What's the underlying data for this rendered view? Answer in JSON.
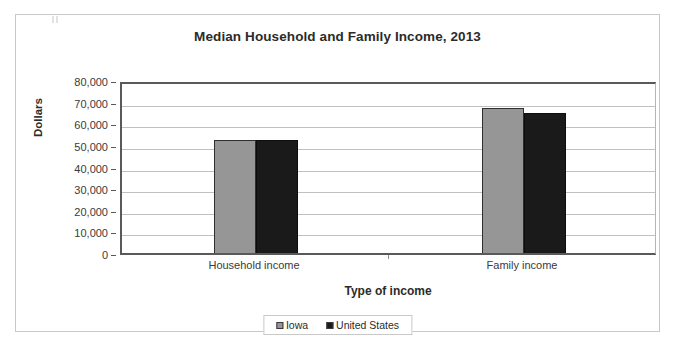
{
  "chart_data": {
    "type": "bar",
    "title": "Median Household and Family Income, 2013",
    "xlabel": "Type of income",
    "ylabel": "Dollars",
    "categories": [
      "Household income",
      "Family income"
    ],
    "series": [
      {
        "name": "Iowa",
        "color": "#969696",
        "values": [
          52200,
          67200
        ]
      },
      {
        "name": "United States",
        "color": "#1a1a1a",
        "values": [
          52200,
          64600
        ]
      }
    ],
    "ylim": [
      0,
      80000
    ],
    "ytick_values": [
      0,
      10000,
      20000,
      30000,
      40000,
      50000,
      60000,
      70000,
      80000
    ],
    "ytick_labels": [
      "0",
      "10,000",
      "20,000",
      "30,000",
      "40,000",
      "50,000",
      "60,000",
      "70,000",
      "80,000"
    ],
    "grid": true,
    "grid_axis": "y",
    "legend_position": "bottom",
    "legend_entries": [
      "Iowa",
      "United States"
    ]
  },
  "frame": {
    "border_color": "#c9c9c9",
    "background": "#ffffff"
  }
}
